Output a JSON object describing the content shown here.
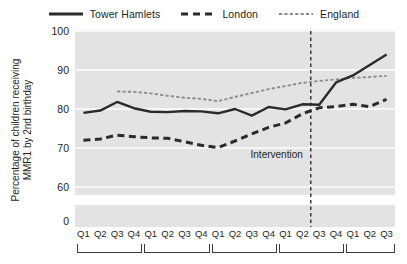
{
  "chart_data": {
    "type": "line",
    "title": "",
    "xlabel": "",
    "ylabel": "Percentage of children receiving MMR1 by 2nd birthday",
    "ylabel_line1": "Percentage of children receiving",
    "ylabel_line2": "MMR1 by 2nd birthday",
    "ylim": [
      60,
      100
    ],
    "yticks": [
      100,
      90,
      80,
      70,
      60,
      0
    ],
    "axis_break": true,
    "grid": true,
    "legend_position": "top",
    "categories": [
      "Q1",
      "Q2",
      "Q3",
      "Q4",
      "Q1",
      "Q2",
      "Q3",
      "Q4",
      "Q1",
      "Q2",
      "Q3",
      "Q4",
      "Q1",
      "Q2",
      "Q3",
      "Q4",
      "Q1",
      "Q2",
      "Q3"
    ],
    "year_groups": [
      4,
      4,
      4,
      4,
      3
    ],
    "annotations": [
      {
        "text": "Intervention",
        "type": "vertical-line",
        "x_index": 13.5,
        "line_style": "dashed"
      }
    ],
    "series": [
      {
        "name": "Tower Hamlets",
        "style": "solid",
        "color": "#2b2b2b",
        "values": [
          79.0,
          79.6,
          81.8,
          80.2,
          79.3,
          79.2,
          79.5,
          79.4,
          78.9,
          80.0,
          78.3,
          80.5,
          79.9,
          81.2,
          81.1,
          86.8,
          88.6,
          91.3,
          94.0
        ]
      },
      {
        "name": "London",
        "style": "dashed",
        "color": "#2b2b2b",
        "values": [
          72.0,
          72.3,
          73.3,
          72.9,
          72.6,
          72.5,
          71.6,
          70.7,
          70.1,
          71.8,
          73.6,
          75.3,
          76.4,
          78.8,
          80.3,
          80.6,
          81.2,
          80.6,
          82.5
        ]
      },
      {
        "name": "England",
        "style": "dotted",
        "color": "#8c8c8c",
        "values": [
          null,
          null,
          84.5,
          84.4,
          84.0,
          83.4,
          82.9,
          82.6,
          82.0,
          83.1,
          84.1,
          85.1,
          85.9,
          86.7,
          87.2,
          87.6,
          88.0,
          88.2,
          88.5
        ]
      }
    ]
  },
  "legend": {
    "items": [
      {
        "label": "Tower Hamlets",
        "key": "solid-line-key"
      },
      {
        "label": "London",
        "key": "dashed-line-key"
      },
      {
        "label": "England",
        "key": "dotted-line-key"
      }
    ]
  },
  "colors": {
    "plot_background": "#e3e3e3",
    "gridline": "#f7f7f7",
    "tower_hamlets": "#2b2b2b",
    "london": "#2b2b2b",
    "england": "#8c8c8c",
    "text": "#231f20"
  }
}
